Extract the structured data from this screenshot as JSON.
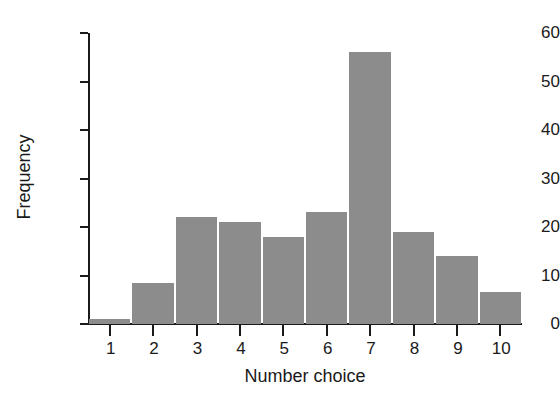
{
  "chart_data": {
    "type": "bar",
    "title": "",
    "subtitle": "",
    "xlabel": "Number choice",
    "ylabel": "Frequency",
    "categories": [
      "1",
      "2",
      "3",
      "4",
      "5",
      "6",
      "7",
      "8",
      "9",
      "10"
    ],
    "values": [
      1,
      8.5,
      22,
      21,
      18,
      23,
      56,
      19,
      14,
      6.5
    ],
    "series": [
      {
        "name": "Frequency",
        "values": [
          1,
          8.5,
          22,
          21,
          18,
          23,
          56,
          19,
          14,
          6.5
        ]
      }
    ],
    "ylim": [
      0,
      60
    ],
    "xlim": [
      0.5,
      10.5
    ],
    "y_ticks": [
      0,
      10,
      20,
      30,
      40,
      50,
      60
    ],
    "y_tick_labels": [
      "0",
      "10",
      "20",
      "30",
      "40",
      "50",
      "60"
    ],
    "x_ticks": [
      1,
      2,
      3,
      4,
      5,
      6,
      7,
      8,
      9,
      10
    ],
    "x_tick_labels": [
      "1",
      "2",
      "3",
      "4",
      "5",
      "6",
      "7",
      "8",
      "9",
      "10"
    ],
    "grid": false,
    "legend": false,
    "legend_position": "none",
    "bar_color": "#8c8c8c",
    "axis_color": "#1a1a1a",
    "background_color": "#ffffff",
    "annotations": []
  }
}
